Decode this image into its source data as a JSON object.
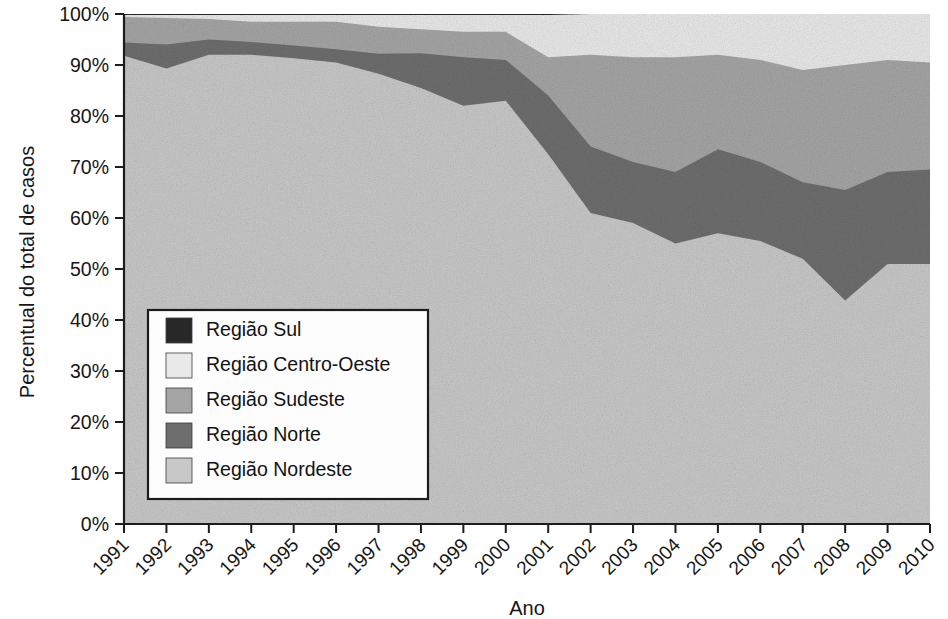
{
  "chart_data": {
    "type": "area",
    "stacked": true,
    "normalized": true,
    "title": "",
    "xlabel": "Ano",
    "ylabel": "Percentual do total de casos",
    "x": [
      1991,
      1992,
      1993,
      1994,
      1995,
      1996,
      1997,
      1998,
      1999,
      2000,
      2001,
      2002,
      2003,
      2004,
      2005,
      2006,
      2007,
      2008,
      2009,
      2010
    ],
    "categories": [
      "1991",
      "1992",
      "1993",
      "1994",
      "1995",
      "1996",
      "1997",
      "1998",
      "1999",
      "2000",
      "2001",
      "2002",
      "2003",
      "2004",
      "2005",
      "2006",
      "2007",
      "2008",
      "2009",
      "2010"
    ],
    "xlim": [
      1991,
      2010
    ],
    "ylim": [
      0,
      100
    ],
    "yticks": [
      0,
      10,
      20,
      30,
      40,
      50,
      60,
      70,
      80,
      90,
      100
    ],
    "ytick_labels": [
      "0%",
      "10%",
      "20%",
      "30%",
      "40%",
      "50%",
      "60%",
      "70%",
      "80%",
      "90%",
      "100%"
    ],
    "grid": false,
    "legend_position": "inside-lower-left",
    "stack_order_bottom_to_top": [
      "Região Nordeste",
      "Região Norte",
      "Região Sudeste",
      "Região Centro-Oeste",
      "Região Sul"
    ],
    "series": [
      {
        "name": "Região Nordeste",
        "color": "#c8c8c8",
        "values": [
          91.8,
          89.3,
          92.0,
          92.0,
          91.3,
          90.5,
          88.3,
          85.5,
          82.0,
          83.0,
          72.5,
          61.0,
          59.0,
          55.0,
          57.0,
          55.5,
          52.0,
          43.8,
          51.0,
          51.0
        ]
      },
      {
        "name": "Região Norte",
        "color": "#6e6e6e",
        "values": [
          2.6,
          4.7,
          3.0,
          2.5,
          2.5,
          2.6,
          3.9,
          6.8,
          9.5,
          8.0,
          11.5,
          13.0,
          12.0,
          14.0,
          16.5,
          15.5,
          15.0,
          21.7,
          18.0,
          18.5
        ]
      },
      {
        "name": "Região Sudeste",
        "color": "#a5a5a5",
        "values": [
          5.0,
          5.2,
          4.0,
          4.0,
          4.7,
          5.4,
          5.3,
          4.7,
          5.0,
          5.5,
          7.5,
          18.0,
          20.5,
          22.5,
          18.5,
          20.0,
          22.0,
          24.5,
          22.0,
          21.0
        ]
      },
      {
        "name": "Região Centro-Oeste",
        "color": "#e9e9e9",
        "values": [
          0.4,
          0.6,
          0.8,
          1.3,
          1.3,
          1.3,
          2.3,
          2.8,
          3.3,
          3.3,
          8.3,
          8.0,
          8.5,
          8.5,
          8.0,
          9.0,
          11.0,
          10.0,
          9.0,
          9.5
        ]
      },
      {
        "name": "Região Sul",
        "color": "#282828",
        "values": [
          0.2,
          0.2,
          0.2,
          0.2,
          0.2,
          0.2,
          0.2,
          0.2,
          0.2,
          0.2,
          0.2,
          0.0,
          0.0,
          0.0,
          0.0,
          0.0,
          0.0,
          0.0,
          0.0,
          0.0
        ]
      }
    ],
    "cumulative_top_boundaries": {
      "Região Nordeste": [
        91.8,
        89.3,
        92.0,
        92.0,
        91.3,
        90.5,
        88.3,
        85.5,
        82.0,
        83.0,
        72.5,
        61.0,
        59.0,
        55.0,
        57.0,
        55.5,
        52.0,
        43.8,
        51.0,
        51.0
      ],
      "Região Norte": [
        94.4,
        94.0,
        95.0,
        94.5,
        93.8,
        93.1,
        92.2,
        92.3,
        91.5,
        91.0,
        84.0,
        74.0,
        71.0,
        69.0,
        73.5,
        71.0,
        67.0,
        65.5,
        69.0,
        69.5
      ],
      "Região Sudeste": [
        99.4,
        99.2,
        99.0,
        98.5,
        98.5,
        98.5,
        97.5,
        97.0,
        96.5,
        96.5,
        91.5,
        92.0,
        91.5,
        91.5,
        92.0,
        91.0,
        89.0,
        90.0,
        91.0,
        90.5
      ],
      "Região Centro-Oeste": [
        99.8,
        99.8,
        99.8,
        99.8,
        99.8,
        99.8,
        99.8,
        99.8,
        99.8,
        99.8,
        99.8,
        100.0,
        100.0,
        100.0,
        100.0,
        100.0,
        100.0,
        100.0,
        100.0,
        100.0
      ],
      "Região Sul": [
        100,
        100,
        100,
        100,
        100,
        100,
        100,
        100,
        100,
        100,
        100,
        100,
        100,
        100,
        100,
        100,
        100,
        100,
        100,
        100
      ]
    }
  },
  "axes": {
    "y_title": "Percentual do total de casos",
    "x_title": "Ano",
    "y_tick_labels": [
      "100%",
      "90%",
      "80%",
      "70%",
      "60%",
      "50%",
      "40%",
      "30%",
      "20%",
      "10%",
      "0%"
    ],
    "x_tick_labels": [
      "1991",
      "1992",
      "1993",
      "1994",
      "1995",
      "1996",
      "1997",
      "1998",
      "1999",
      "2000",
      "2001",
      "2002",
      "2003",
      "2004",
      "2005",
      "2006",
      "2007",
      "2008",
      "2009",
      "2010"
    ]
  },
  "legend": {
    "items": [
      {
        "label": "Região Sul",
        "color": "#282828"
      },
      {
        "label": "Região Centro-Oeste",
        "color": "#e9e9e9"
      },
      {
        "label": "Região Sudeste",
        "color": "#a5a5a5"
      },
      {
        "label": "Região Norte",
        "color": "#6e6e6e"
      },
      {
        "label": "Região Nordeste",
        "color": "#c8c8c8"
      }
    ]
  },
  "colors": {
    "axis": "#1c1c1c",
    "background": "#ffffff",
    "text": "#161616"
  }
}
